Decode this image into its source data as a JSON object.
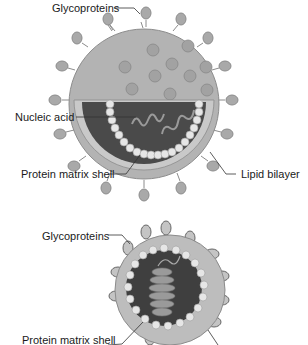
{
  "figure_1": {
    "title": "Enveloped virus cross-section (top)",
    "labels": {
      "glycoproteins": "Glycoproteins",
      "nucleic_acid": "Nucleic acid",
      "protein_matrix_shell": "Protein matrix shell",
      "lipid_bilayer": "Lipid bilayer"
    }
  },
  "figure_2": {
    "title": "Enveloped virus cutaway (bottom)",
    "labels": {
      "glycoproteins": "Glycoproteins",
      "protein_matrix_shell": "Protein matrix shell"
    }
  },
  "colors": {
    "envelope": "#b3b3b3",
    "envelope_stroke": "#8c8c8c",
    "core_dark": "#4a4a4a",
    "shell_beads": "#e6e6e6",
    "spike": "#a6a6a6",
    "leader_line": "#333333"
  }
}
